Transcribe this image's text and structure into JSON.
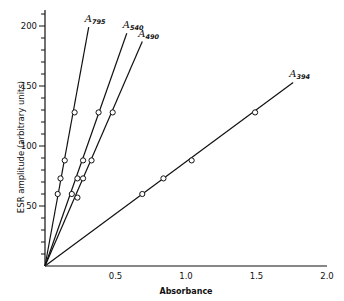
{
  "chart_data": {
    "type": "line",
    "title": "",
    "xlabel": "Absorbance",
    "ylabel": "ESR amplitude (arbitrary units)",
    "xlim": [
      0,
      2.0
    ],
    "ylim": [
      0,
      210
    ],
    "xticks": [
      0.5,
      1.0,
      1.5,
      2.0
    ],
    "xtick_labels": [
      "0.5",
      "1.0",
      "1.5",
      "2.0"
    ],
    "yticks": [
      50,
      100,
      150,
      200
    ],
    "ytick_labels": [
      "50",
      "100",
      "150",
      "200"
    ],
    "y_minor_step": 10,
    "grid": false,
    "legend": "inline labels at line ends",
    "series": [
      {
        "name": "A795",
        "label_main": "A",
        "label_sub": "795",
        "points": [
          [
            0.09,
            60
          ],
          [
            0.11,
            73
          ],
          [
            0.14,
            88
          ],
          [
            0.21,
            128
          ]
        ],
        "line": [
          [
            0,
            0
          ],
          [
            0.31,
            199
          ]
        ]
      },
      {
        "name": "A540",
        "label_main": "A",
        "label_sub": "540",
        "points": [
          [
            0.19,
            60
          ],
          [
            0.23,
            73
          ],
          [
            0.27,
            88
          ],
          [
            0.38,
            128
          ]
        ],
        "line": [
          [
            0,
            0
          ],
          [
            0.58,
            194
          ]
        ]
      },
      {
        "name": "A490",
        "label_main": "A",
        "label_sub": "490",
        "points": [
          [
            0.23,
            57
          ],
          [
            0.27,
            73
          ],
          [
            0.33,
            88
          ],
          [
            0.48,
            128
          ]
        ],
        "line": [
          [
            0,
            0
          ],
          [
            0.69,
            187
          ]
        ]
      },
      {
        "name": "A394",
        "label_main": "A",
        "label_sub": "394",
        "points": [
          [
            0.69,
            60
          ],
          [
            0.84,
            73
          ],
          [
            1.04,
            88
          ],
          [
            1.49,
            128
          ]
        ],
        "line": [
          [
            0,
            0
          ],
          [
            1.76,
            153
          ]
        ]
      }
    ]
  }
}
